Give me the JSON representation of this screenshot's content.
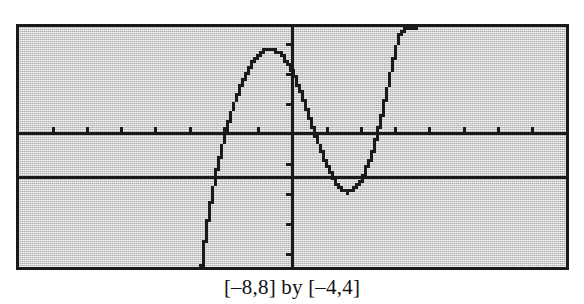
{
  "figure": {
    "caption": "[–8,8] by [–4,4]",
    "screen_label": "graphing-calculator-screen"
  },
  "colors": {
    "screen_background": "#c9c9c9",
    "screen_border": "#1a1a1a",
    "ink": "#1a1a1a",
    "page_background": "#ffffff",
    "caption_text": "#121212"
  },
  "chart_data": {
    "type": "line",
    "title": "",
    "subtitle": "",
    "caption": "[–8,8] by [–4,4]",
    "xlabel": "",
    "ylabel": "",
    "xlim": [
      -8,
      8
    ],
    "ylim": [
      -4,
      4
    ],
    "xtick_interval": 1,
    "ytick_interval": 1,
    "xticks": [
      -8,
      -7,
      -6,
      -5,
      -4,
      -3,
      -2,
      -1,
      0,
      1,
      2,
      3,
      4,
      5,
      6,
      7,
      8
    ],
    "yticks": [
      -4,
      -3,
      -2,
      -1,
      0,
      1,
      2,
      3,
      4
    ],
    "grid": false,
    "legend": "none",
    "axes_style": "calculator-axes-with-tickmarks",
    "series": [
      {
        "name": "curve",
        "style": "pixelated-dotted",
        "note": "downward-opening arc rising from below-left, peak above x-axis left of origin, falling through origin region to a minimum that touches the horizontal line y = -1.45, then rising steeply off the top of the window",
        "x": [
          -2.7,
          -2.65,
          -2.6,
          -2.5,
          -2.4,
          -2.3,
          -2.2,
          -2.1,
          -2.0,
          -1.9,
          -1.8,
          -1.7,
          -1.6,
          -1.5,
          -1.4,
          -1.3,
          -1.2,
          -1.1,
          -1.0,
          -0.9,
          -0.8,
          -0.7,
          -0.6,
          -0.5,
          -0.4,
          -0.3,
          -0.2,
          -0.1,
          0.0,
          0.1,
          0.2,
          0.3,
          0.4,
          0.5,
          0.6,
          0.7,
          0.8,
          0.9,
          1.0,
          1.1,
          1.2,
          1.3,
          1.4,
          1.5,
          1.6,
          1.7,
          1.8,
          1.9,
          2.0,
          2.1,
          2.2,
          2.3,
          2.4,
          2.5,
          2.6,
          2.7,
          2.8,
          2.9,
          3.0,
          3.1,
          3.2,
          3.3,
          3.4,
          3.5,
          3.55
        ],
        "y": [
          -4.0,
          -3.55,
          -3.1,
          -2.3,
          -1.6,
          -1.0,
          -0.45,
          0.05,
          0.5,
          0.92,
          1.3,
          1.64,
          1.95,
          2.23,
          2.48,
          2.7,
          2.89,
          3.04,
          3.16,
          3.25,
          3.3,
          3.32,
          3.3,
          3.25,
          3.16,
          3.04,
          2.88,
          2.68,
          2.45,
          2.19,
          1.9,
          1.59,
          1.26,
          0.92,
          0.58,
          0.25,
          -0.07,
          -0.37,
          -0.64,
          -0.88,
          -1.08,
          -1.25,
          -1.37,
          -1.44,
          -1.45,
          -1.42,
          -1.33,
          -1.19,
          -1.0,
          -0.75,
          -0.45,
          -0.1,
          0.3,
          0.75,
          1.25,
          1.78,
          2.33,
          2.88,
          3.4,
          3.8,
          3.95,
          4.0,
          4.0,
          4.0,
          4.0
        ]
      },
      {
        "name": "horizontal-line",
        "style": "solid",
        "note": "horizontal reference line tangent to the curve's minimum",
        "equation_y": -1.45,
        "x": [
          -8,
          8
        ],
        "y": [
          -1.45,
          -1.45
        ]
      }
    ]
  }
}
